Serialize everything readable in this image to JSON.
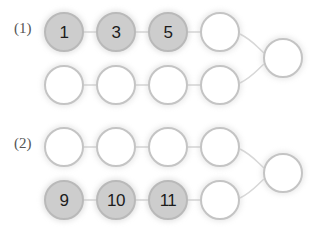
{
  "figure": {
    "background_color": "#ffffff",
    "node_diameter": 40,
    "node_pitch_x": 52,
    "filled_fill_color": "#cdcdcd",
    "filled_ring_color": "#b9b9b9",
    "empty_fill_color": "#ffffff",
    "empty_ring_color": "#c4c4c4",
    "edge_color": "#d8d8d8",
    "label_color": "#555555"
  },
  "groups": [
    {
      "label": "(1)",
      "label_x": 14,
      "label_y": 20,
      "top_row": {
        "y": 12,
        "nodes": [
          {
            "text": "1",
            "filled": true,
            "x": 44
          },
          {
            "text": "3",
            "filled": true,
            "x": 96
          },
          {
            "text": "5",
            "filled": true,
            "x": 148
          },
          {
            "text": "",
            "filled": false,
            "x": 200
          }
        ]
      },
      "bottom_row": {
        "y": 65,
        "nodes": [
          {
            "text": "",
            "filled": false,
            "x": 44
          },
          {
            "text": "",
            "filled": false,
            "x": 96
          },
          {
            "text": "",
            "filled": false,
            "x": 148
          },
          {
            "text": "",
            "filled": false,
            "x": 200
          }
        ]
      },
      "end_node": {
        "text": "",
        "filled": false,
        "x": 263,
        "y": 38
      }
    },
    {
      "label": "(2)",
      "label_x": 14,
      "label_y": 135,
      "top_row": {
        "y": 127,
        "nodes": [
          {
            "text": "",
            "filled": false,
            "x": 44
          },
          {
            "text": "",
            "filled": false,
            "x": 96
          },
          {
            "text": "",
            "filled": false,
            "x": 148
          },
          {
            "text": "",
            "filled": false,
            "x": 200
          }
        ]
      },
      "bottom_row": {
        "y": 180,
        "nodes": [
          {
            "text": "9",
            "filled": true,
            "x": 44
          },
          {
            "text": "10",
            "filled": true,
            "x": 96
          },
          {
            "text": "11",
            "filled": true,
            "x": 148
          },
          {
            "text": "",
            "filled": false,
            "x": 200
          }
        ]
      },
      "end_node": {
        "text": "",
        "filled": false,
        "x": 263,
        "y": 153
      }
    }
  ]
}
